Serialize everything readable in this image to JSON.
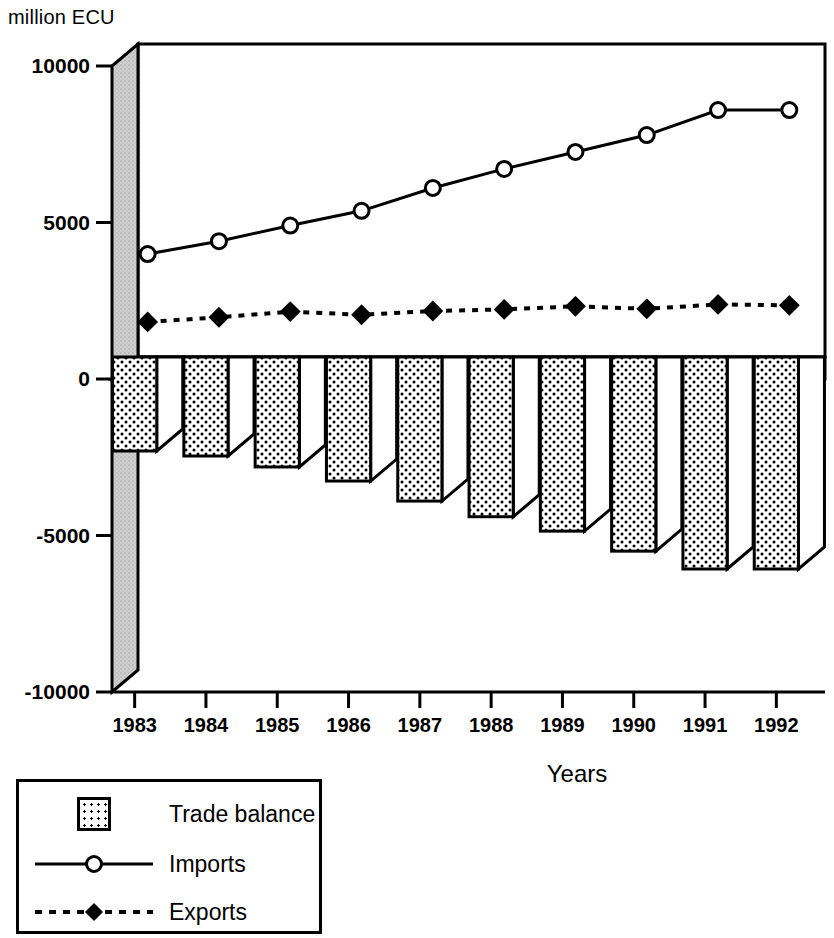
{
  "axis_unit_label": "million ECU",
  "x_axis_title": "Years",
  "legend": {
    "items": [
      {
        "label": "Trade balance",
        "key": "dotted-swatch"
      },
      {
        "label": "Imports",
        "key": "solid-line-open-circle"
      },
      {
        "label": "Exports",
        "key": "dashed-line-filled-diamond"
      }
    ]
  },
  "chart_data": {
    "type": "bar",
    "title": "",
    "subtitle": "",
    "xlabel": "Years",
    "ylabel": "million ECU",
    "categories": [
      "1983",
      "1984",
      "1985",
      "1986",
      "1987",
      "1988",
      "1989",
      "1990",
      "1991",
      "1992"
    ],
    "ylim": [
      -10000,
      10000
    ],
    "ytick_labels": [
      "10000",
      "5000",
      "0",
      "-5000",
      "-10000"
    ],
    "ytick_values": [
      10000,
      5000,
      0,
      -5000,
      -10000
    ],
    "grid": false,
    "legend_position": "below-left",
    "style": "3d-column-with-overlaid-lines",
    "series": [
      {
        "name": "Trade balance",
        "type": "bar",
        "values": [
          -2300,
          -2460,
          -2810,
          -3260,
          -3900,
          -4400,
          -4860,
          -5500,
          -6070,
          -6070
        ]
      },
      {
        "name": "Imports",
        "type": "line",
        "marker": "open-circle",
        "line": "solid",
        "values": [
          3290,
          3700,
          4200,
          4670,
          5400,
          6010,
          6550,
          7090,
          7890,
          7890
        ]
      },
      {
        "name": "Exports",
        "type": "line",
        "marker": "filled-diamond",
        "line": "dashed",
        "values": [
          1120,
          1270,
          1450,
          1350,
          1470,
          1520,
          1620,
          1540,
          1680,
          1650
        ]
      }
    ]
  },
  "colors": {
    "ink": "#000000",
    "wall": "#c9c9c9",
    "bar_side": "#ffffff",
    "background": "#ffffff"
  }
}
